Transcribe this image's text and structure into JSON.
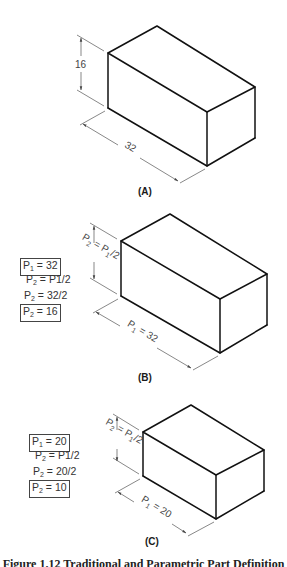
{
  "figure": {
    "caption": "Figure 1.12 Traditional and Parametric Part Definition",
    "panels": [
      {
        "id": "A",
        "label": "(A)",
        "height_dim": "16",
        "length_dim": "32"
      },
      {
        "id": "B",
        "label": "(B)",
        "height_dim": {
          "main": "P",
          "sub": "2",
          "eq": " = P",
          "sub2": "1",
          "tail": "/2"
        },
        "length_dim": {
          "main": "P",
          "sub": "1",
          "tail": " = 32"
        },
        "equations": [
          {
            "text_main": "P",
            "text_sub": "1",
            "text_tail": " = 32",
            "boxed": true
          },
          {
            "text_main": "P",
            "text_sub": "2",
            "text_tail": " = P1/2",
            "boxed": false
          },
          {
            "text_main": "P",
            "text_sub": "2",
            "text_tail": " = 32/2",
            "boxed": false
          },
          {
            "text_main": "P",
            "text_sub": "2",
            "text_tail": " = 16",
            "boxed": true
          }
        ]
      },
      {
        "id": "C",
        "label": "(C)",
        "height_dim": {
          "main": "P",
          "sub": "2",
          "eq": " = P",
          "sub2": "1",
          "tail": "/2"
        },
        "length_dim": {
          "main": "P",
          "sub": "1",
          "tail": " = 20"
        },
        "equations": [
          {
            "text_main": "P",
            "text_sub": "1",
            "text_tail": " = 20",
            "boxed": true
          },
          {
            "text_main": "P",
            "text_sub": "2",
            "text_tail": " = P1/2",
            "boxed": false
          },
          {
            "text_main": "P",
            "text_sub": "2",
            "text_tail": " = 20/2",
            "boxed": false
          },
          {
            "text_main": "P",
            "text_sub": "2",
            "text_tail": " = 10",
            "boxed": true
          }
        ]
      }
    ]
  }
}
